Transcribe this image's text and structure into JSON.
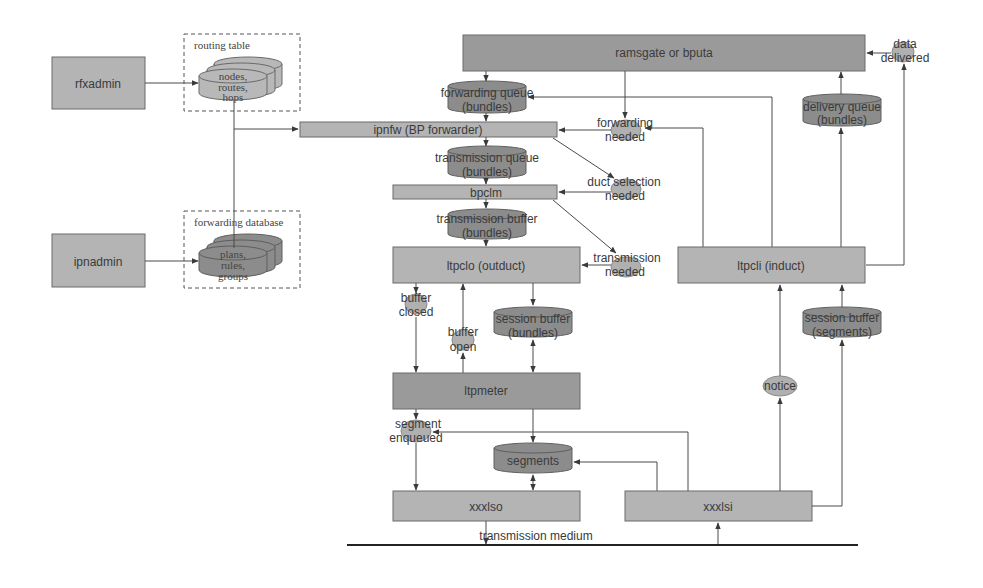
{
  "diagram": {
    "admins": {
      "rfxadmin": "rfxadmin",
      "ipnadmin": "ipnadmin"
    },
    "routing_table": {
      "title": "routing table",
      "db_line1": "nodes,",
      "db_line2": "routes,",
      "db_line3": "hops"
    },
    "forwarding_database": {
      "title": "forwarding database",
      "db_line1": "plans,",
      "db_line2": "rules,",
      "db_line3": "groups"
    },
    "processes": {
      "ramsgate": "ramsgate or bputa",
      "ipnfw": "ipnfw (BP forwarder)",
      "bpclm": "bpclm",
      "ltpclo": "ltpclo (outduct)",
      "ltpcli": "ltpcli (induct)",
      "ltpmeter": "ltpmeter",
      "xxxlso": "xxxlso",
      "xxxlsi": "xxxlsi"
    },
    "queues": {
      "forwarding_queue": [
        "forwarding queue",
        "(bundles)"
      ],
      "transmission_queue": [
        "transmission queue",
        "(bundles)"
      ],
      "transmission_buffer": [
        "transmission buffer",
        "(bundles)"
      ],
      "session_buffer_out": [
        "session buffer",
        "(bundles)"
      ],
      "session_buffer_in": [
        "session buffer",
        "(segments)"
      ],
      "delivery_queue": [
        "delivery queue",
        "(bundles)"
      ],
      "segments": "segments"
    },
    "events": {
      "data_delivered": [
        "data",
        "delivered"
      ],
      "forwarding_needed": [
        "forwarding",
        "needed"
      ],
      "duct_selection_needed": [
        "duct selection",
        "needed"
      ],
      "transmission_needed": [
        "transmission",
        "needed"
      ],
      "buffer_closed": [
        "buffer",
        "closed"
      ],
      "buffer_open": [
        "buffer",
        "open"
      ],
      "segment_enqueued": [
        "segment",
        "enqueued"
      ],
      "notice": "notice"
    },
    "medium": "transmission medium"
  },
  "colors": {
    "box": "#b4b4b4",
    "box_dark": "#9a9a9a",
    "cylinder": "#8c8c8c",
    "event": "#b0b0b0",
    "line": "#4a4a4a"
  }
}
